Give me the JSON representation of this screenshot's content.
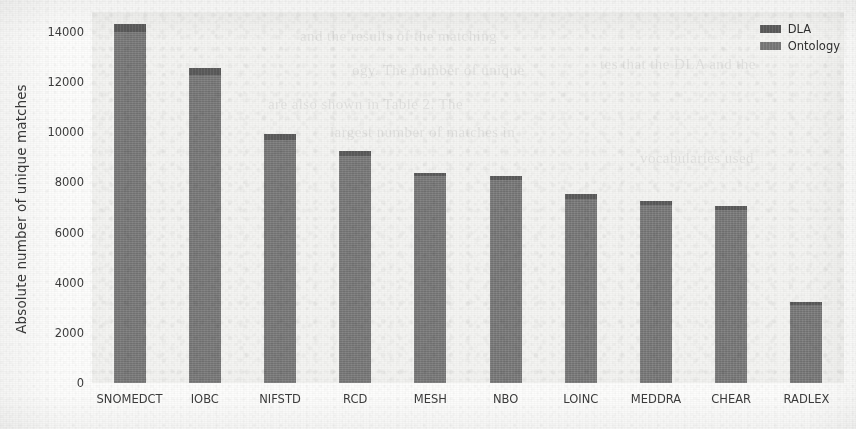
{
  "chart_data": {
    "type": "bar",
    "title": "",
    "subtitle": "",
    "xlabel": "",
    "ylabel": "Absolute number of unique matches",
    "categories": [
      "SNOMEDCT",
      "IOBC",
      "NIFSTD",
      "RCD",
      "MESH",
      "NBO",
      "LOINC",
      "MEDDRA",
      "CHEAR",
      "RADLEX"
    ],
    "series": [
      {
        "name": "Ontology",
        "color": "#7d7d7d",
        "values": [
          14000,
          12300,
          9700,
          9050,
          8250,
          8100,
          7350,
          7100,
          6900,
          3100
        ]
      },
      {
        "name": "DLA",
        "color": "#5f5f5f",
        "values": [
          320,
          250,
          220,
          220,
          140,
          150,
          190,
          170,
          160,
          130
        ]
      }
    ],
    "totals": [
      14320,
      12550,
      9920,
      9270,
      8390,
      8250,
      7540,
      7270,
      7060,
      3230
    ],
    "stacked": true,
    "ylim": [
      0,
      14800
    ],
    "yticks": [
      0,
      2000,
      4000,
      6000,
      8000,
      10000,
      12000,
      14000
    ],
    "ytick_labels": [
      "0",
      "2000",
      "4000",
      "6000",
      "8000",
      "10000",
      "12000",
      "14000"
    ],
    "grid": false,
    "legend_position": "upper right",
    "legend_entries": [
      "DLA",
      "Ontology"
    ],
    "plot_background": "#f4f4f2",
    "figure_background": "#fdfdfc"
  },
  "legend": {
    "items": [
      {
        "label": "DLA",
        "color": "#5f5f5f"
      },
      {
        "label": "Ontology",
        "color": "#7d7d7d"
      }
    ]
  },
  "scan_ghost_lines": [
    "and the results of the matching",
    "ogy. The number of unique",
    "are also shown in Table 2. The",
    "largest number of matches in",
    "tes that the DLA and the",
    "vocabularies used"
  ]
}
